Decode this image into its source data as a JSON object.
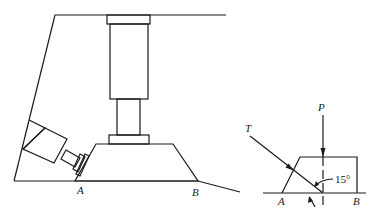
{
  "figure": {
    "left_diagram": {
      "description": "Hydraulic press with vertical cylinder pushing a trapezoidal block, and an inclined jack pushing the block from the left",
      "labels": {
        "point_a": "A",
        "point_b": "B"
      }
    },
    "right_diagram": {
      "description": "Free-body sketch of the block with applied forces",
      "labels": {
        "force_p": "P",
        "force_t": "T",
        "angle": "15°",
        "point_a": "A",
        "point_b": "B"
      }
    },
    "colors": {
      "line": "#1a1a1a",
      "background": "#ffffff"
    }
  }
}
